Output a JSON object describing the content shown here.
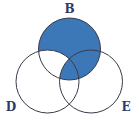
{
  "diagram": {
    "type": "venn",
    "sets": [
      {
        "id": "B",
        "label": "B",
        "cx": 69.5,
        "cy": 49,
        "r": 31
      },
      {
        "id": "D",
        "label": "D",
        "cx": 47.5,
        "cy": 81.5,
        "r": 31.5
      },
      {
        "id": "E",
        "label": "E",
        "cx": 91,
        "cy": 81.5,
        "r": 31.5
      }
    ],
    "shaded_region": "B ∩ (D' ∪ E)",
    "colors": {
      "fill": "#3c78b8",
      "stroke": "#3a3a4a",
      "label": "#2a3a6a"
    }
  }
}
